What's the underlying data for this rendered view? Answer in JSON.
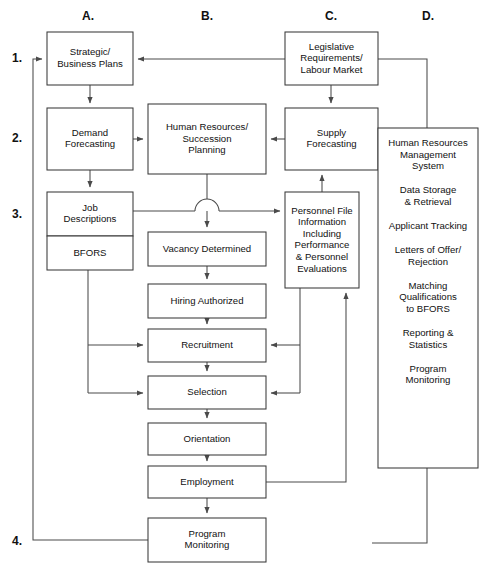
{
  "diagram": {
    "column_labels": [
      {
        "id": "A",
        "text": "A.",
        "x": 88,
        "y": 20
      },
      {
        "id": "B",
        "text": "B.",
        "x": 207,
        "y": 20
      },
      {
        "id": "C",
        "text": "C.",
        "x": 331,
        "y": 20
      },
      {
        "id": "D",
        "text": "D.",
        "x": 428,
        "y": 20
      }
    ],
    "row_labels": [
      {
        "id": "1",
        "text": "1.",
        "x": 12,
        "y": 62
      },
      {
        "id": "2",
        "text": "2.",
        "x": 12,
        "y": 142
      },
      {
        "id": "3",
        "text": "3.",
        "x": 12,
        "y": 218
      },
      {
        "id": "4",
        "text": "4.",
        "x": 12,
        "y": 545
      }
    ],
    "boxes": [
      {
        "id": "strategic-business-plans",
        "x": 47,
        "y": 32,
        "w": 86,
        "h": 53,
        "lines": [
          "Strategic/",
          "Business Plans"
        ]
      },
      {
        "id": "demand-forecasting",
        "x": 47,
        "y": 108,
        "w": 86,
        "h": 62,
        "lines": [
          "Demand",
          "Forecasting"
        ]
      },
      {
        "id": "job-descriptions",
        "x": 47,
        "y": 192,
        "w": 86,
        "h": 44,
        "lines": [
          "Job",
          "Descriptions"
        ]
      },
      {
        "id": "bfors",
        "x": 47,
        "y": 236,
        "w": 86,
        "h": 34,
        "lines": [
          "BFORS"
        ]
      },
      {
        "id": "human-resources-succession-planning",
        "x": 148,
        "y": 104,
        "w": 118,
        "h": 70,
        "lines": [
          "Human Resources/",
          "Succession",
          "Planning"
        ]
      },
      {
        "id": "vacancy-determined",
        "x": 148,
        "y": 232,
        "w": 118,
        "h": 34,
        "lines": [
          "Vacancy Determined"
        ]
      },
      {
        "id": "hiring-authorized",
        "x": 148,
        "y": 284,
        "w": 118,
        "h": 34,
        "lines": [
          "Hiring Authorized"
        ]
      },
      {
        "id": "recruitment",
        "x": 148,
        "y": 329,
        "w": 118,
        "h": 33,
        "lines": [
          "Recruitment"
        ]
      },
      {
        "id": "selection",
        "x": 148,
        "y": 376,
        "w": 118,
        "h": 33,
        "lines": [
          "Selection"
        ]
      },
      {
        "id": "orientation",
        "x": 148,
        "y": 423,
        "w": 118,
        "h": 32,
        "lines": [
          "Orientation"
        ]
      },
      {
        "id": "employment",
        "x": 148,
        "y": 466,
        "w": 118,
        "h": 32,
        "lines": [
          "Employment"
        ]
      },
      {
        "id": "program-monitoring",
        "x": 148,
        "y": 518,
        "w": 118,
        "h": 44,
        "lines": [
          "Program",
          "Monitoring"
        ]
      },
      {
        "id": "legislative-requirements-labour-market",
        "x": 285,
        "y": 32,
        "w": 93,
        "h": 53,
        "lines": [
          "Legislative",
          "Requirements/",
          "Labour Market"
        ]
      },
      {
        "id": "supply-forecasting",
        "x": 285,
        "y": 108,
        "w": 93,
        "h": 62,
        "lines": [
          "Supply",
          "Forecasting"
        ]
      },
      {
        "id": "personnel-file-information",
        "x": 285,
        "y": 192,
        "w": 74,
        "h": 96,
        "lines": [
          "Personnel File",
          "Information",
          "Including",
          "Performance",
          "& Personnel",
          "Evaluations"
        ]
      }
    ],
    "hrms_panel": {
      "id": "human-resources-management-system",
      "x": 378,
      "y": 128,
      "w": 100,
      "h": 340,
      "items": [
        {
          "lines": [
            "Human Resources",
            "Management",
            "System"
          ]
        },
        {
          "lines": [
            "Data Storage",
            "& Retrieval"
          ]
        },
        {
          "lines": [
            "Applicant Tracking"
          ]
        },
        {
          "lines": [
            "Letters of Offer/",
            "Rejection"
          ]
        },
        {
          "lines": [
            "Matching",
            "Qualifications",
            "to BFORS"
          ]
        },
        {
          "lines": [
            "Reporting &",
            "Statistics"
          ]
        },
        {
          "lines": [
            "Program",
            "Monitoring"
          ]
        }
      ]
    },
    "connectors": [
      {
        "id": "legislative-to-strategic",
        "d": "M 285 59 L 138 59",
        "arrow": "end"
      },
      {
        "id": "strategic-to-demand",
        "d": "M 90 85 L 90 103",
        "arrow": "end"
      },
      {
        "id": "legislative-to-supply",
        "d": "M 331 85 L 331 103",
        "arrow": "end"
      },
      {
        "id": "demand-to-hrsp",
        "d": "M 133 139 L 143 139",
        "arrow": "end"
      },
      {
        "id": "supply-to-hrsp",
        "d": "M 285 139 L 271 139",
        "arrow": "end"
      },
      {
        "id": "demand-to-job",
        "d": "M 90 170 L 90 187",
        "arrow": "end"
      },
      {
        "id": "personnel-to-supply",
        "d": "M 322 192 L 322 175",
        "arrow": "end"
      },
      {
        "id": "hrsp-to-vacancy-upper",
        "d": "M 207 174 L 207 199",
        "arrow": "none"
      },
      {
        "id": "hrsp-to-vacancy-lower",
        "d": "M 207 211 L 207 227",
        "arrow": "end"
      },
      {
        "id": "job-to-personnel-left",
        "d": "M 133 211 L 195 211",
        "arrow": "none"
      },
      {
        "id": "job-to-personnel-right",
        "d": "M 219 211 L 280 211",
        "arrow": "end"
      },
      {
        "id": "line-jump-arc",
        "d": "M 195 211 A 12 12 0 0 1 219 211",
        "arrow": "none"
      },
      {
        "id": "vacancy-to-hiring",
        "d": "M 207 266 L 207 279",
        "arrow": "end"
      },
      {
        "id": "hiring-to-recruitment",
        "d": "M 207 318 L 207 324",
        "arrow": "end"
      },
      {
        "id": "recruitment-to-selection",
        "d": "M 207 362 L 207 371",
        "arrow": "end"
      },
      {
        "id": "selection-to-orientation",
        "d": "M 207 409 L 207 418",
        "arrow": "end"
      },
      {
        "id": "orientation-to-employment",
        "d": "M 207 455 L 207 461",
        "arrow": "end"
      },
      {
        "id": "employment-to-program-monitoring",
        "d": "M 207 498 L 207 513",
        "arrow": "end"
      },
      {
        "id": "bfors-branch-trunk",
        "d": "M 88 270 L 88 393",
        "arrow": "none"
      },
      {
        "id": "bfors-to-recruitment",
        "d": "M 88 345 L 143 345",
        "arrow": "end"
      },
      {
        "id": "bfors-to-selection",
        "d": "M 88 393 L 143 393",
        "arrow": "end"
      },
      {
        "id": "personnel-down-trunk",
        "d": "M 300 288 L 300 393",
        "arrow": "none"
      },
      {
        "id": "personnel-to-recruitment",
        "d": "M 300 345 L 271 345",
        "arrow": "end"
      },
      {
        "id": "personnel-to-selection",
        "d": "M 300 393 L 271 393",
        "arrow": "end"
      },
      {
        "id": "employment-to-personnel-feedback",
        "d": "M 266 482 L 346 482 L 346 293",
        "arrow": "end"
      },
      {
        "id": "program-monitoring-to-strategic-feedback",
        "d": "M 148 540 L 33 540 L 33 59 L 42 59",
        "arrow": "end"
      },
      {
        "id": "legislative-to-hrms",
        "d": "M 378 59 L 427 59 L 427 128",
        "arrow": "none"
      },
      {
        "id": "hrms-to-bottom",
        "d": "M 427 468 L 427 543 L 372 543",
        "arrow": "none"
      }
    ]
  }
}
